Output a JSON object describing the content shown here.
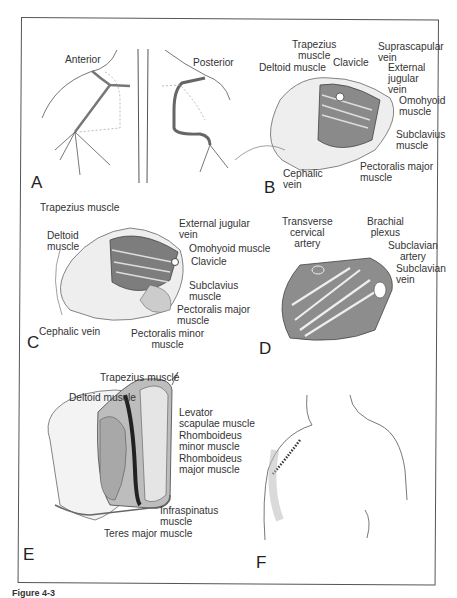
{
  "figure": {
    "caption_fragment": "Figure 4-3",
    "panels": {
      "A": {
        "letter": "A",
        "sublabels": [
          "Anterior",
          "Posterior"
        ]
      },
      "B": {
        "letter": "B",
        "labels": {
          "trapezius": "Trapezius\nmuscle",
          "deltoid": "Deltoid muscle",
          "clavicle": "Clavicle",
          "suprascapular": "Suprascapular\nvein",
          "ext_jugular": "External\njugular\nvein",
          "omohyoid": "Omohyoid\nmuscle",
          "subclavius": "Subclavius\nmuscle",
          "pect_major": "Pectoralis major\nmuscle",
          "cephalic": "Cephalic\nvein"
        }
      },
      "C": {
        "letter": "C",
        "labels": {
          "trapezius": "Trapezius muscle",
          "deltoid": "Deltoid\nmuscle",
          "ext_jugular": "External jugular\nvein",
          "omohyoid": "Omohyoid muscle",
          "clavicle": "Clavicle",
          "subclavius": "Subclavius\nmuscle",
          "pect_major": "Pectoralis major\nmuscle",
          "cephalic": "Cephalic vein",
          "pect_minor": "Pectoralis minor\nmuscle"
        }
      },
      "D": {
        "letter": "D",
        "labels": {
          "transverse_cervical": "Transverse\ncervical\nartery",
          "brachial_plexus": "Brachial\nplexus",
          "subclavian_artery": "Subclavian\nartery",
          "subclavian_vein": "Subclavian\nvein"
        }
      },
      "E": {
        "letter": "E",
        "labels": {
          "trapezius": "Trapezius muscle",
          "deltoid": "Deltoid muscle",
          "levator": "Levator\nscapulae muscle",
          "rhomb_minor": "Rhomboideus\nminor muscle",
          "rhomb_major": "Rhomboideus\nmajor muscle",
          "infraspinatus": "Infraspinatus\nmuscle",
          "teres_major": "Teres major muscle"
        }
      },
      "F": {
        "letter": "F"
      }
    }
  }
}
